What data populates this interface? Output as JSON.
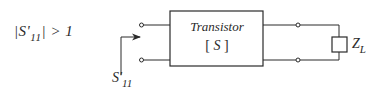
{
  "diagram": {
    "condition": {
      "prefix": "|S'",
      "subscript": "11",
      "suffix": "| > 1"
    },
    "input_label": {
      "main": "S'",
      "subscript": "11"
    },
    "block": {
      "title": "Transistor",
      "matrix_open": "[",
      "matrix_symbol": "S",
      "matrix_close": "]"
    },
    "load": {
      "main": "Z",
      "subscript": "L"
    },
    "colors": {
      "line": "#2a2a2a",
      "background": "#ffffff"
    }
  }
}
